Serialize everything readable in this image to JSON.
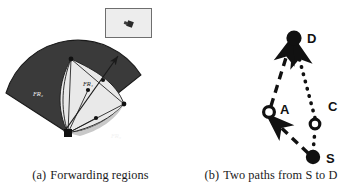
{
  "figure": {
    "panels": [
      {
        "id": "panel-a",
        "caption_tag": "(a)",
        "caption_text": "Forwarding regions",
        "inset": {
          "present": true,
          "fill_color": "#ededed",
          "border_color": "#6e6e6e"
        },
        "diagram": {
          "type": "sector-fan",
          "apex_label": "S",
          "region_labels": [
            "FR₂",
            "FR₁",
            "FR₃"
          ],
          "node_labels": [
            "A",
            "B",
            "C",
            "D",
            "E"
          ],
          "dark_fill": "#3a3a3a",
          "light_fill": "#e3e3e3",
          "mid_fill": "#d2d2d2",
          "outline_color": "#1a1a1a",
          "arrow_label": "d"
        }
      },
      {
        "id": "panel-b",
        "caption_tag": "(b)",
        "caption_text": "Two paths from S to D",
        "diagram": {
          "type": "node-link",
          "nodes": [
            {
              "name": "D",
              "label": "D",
              "style": "filled",
              "x": 113,
              "y": 38
            },
            {
              "name": "A",
              "label": "A",
              "style": "hollow",
              "x": 88,
              "y": 112
            },
            {
              "name": "C",
              "label": "C",
              "style": "hollow",
              "x": 134,
              "y": 124
            },
            {
              "name": "S",
              "label": "S",
              "style": "filled",
              "x": 132,
              "y": 157
            }
          ],
          "edges": [
            {
              "name": "edge-s-a",
              "from": "S",
              "to": "A",
              "style": "dashed",
              "arrow": true
            },
            {
              "name": "edge-a-d",
              "from": "A",
              "to": "D",
              "style": "dashed",
              "arrow": true
            },
            {
              "name": "edge-s-c",
              "from": "S",
              "to": "C",
              "style": "dotted",
              "arrow": false
            },
            {
              "name": "edge-c-d",
              "from": "C",
              "to": "D",
              "style": "dotted",
              "arrow": true
            }
          ],
          "edge_color": "#111111",
          "node_color": "#111111"
        }
      }
    ]
  }
}
